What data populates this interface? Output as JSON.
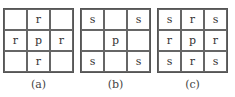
{
  "panels": [
    {
      "caption": "(a)",
      "cells": [
        "",
        "r",
        "",
        "r",
        "p",
        "r",
        "",
        "r",
        ""
      ]
    },
    {
      "caption": "(b)",
      "cells": [
        "s",
        "",
        "s",
        "",
        "p",
        "",
        "s",
        "",
        "s"
      ]
    },
    {
      "caption": "(c)",
      "cells": [
        "s",
        "r",
        "s",
        "r",
        "p",
        "r",
        "s",
        "r",
        "s"
      ]
    }
  ]
}
